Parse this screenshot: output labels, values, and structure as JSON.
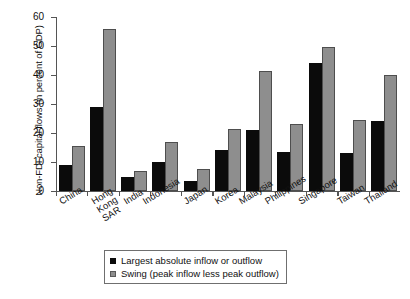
{
  "chart_data": {
    "type": "bar",
    "title": "",
    "xlabel": "",
    "ylabel": "Non-FDI capital flows (in percent of GDP)",
    "ylim": [
      0,
      60
    ],
    "yticks": [
      0,
      10,
      20,
      30,
      40,
      50,
      60
    ],
    "grid": false,
    "legend_position": "bottom-center",
    "categories": [
      "China",
      "Hong Kong\nSAR",
      "India",
      "Indonesia",
      "Japan",
      "Korea",
      "Malaysia",
      "Philippines",
      "Singapore",
      "Taiwan",
      "Thailand"
    ],
    "series": [
      {
        "name": "Largest absolute inflow or outflow",
        "color": "#0b0b0b",
        "values": [
          9,
          29,
          5,
          10,
          3.5,
          14,
          21,
          13.5,
          44,
          13,
          24
        ]
      },
      {
        "name": "Swing (peak inflow less peak outflow)",
        "color": "#8e8e8e",
        "values": [
          15.5,
          56,
          7,
          17,
          7.5,
          21.5,
          41.5,
          23,
          49.5,
          24.5,
          40
        ]
      }
    ]
  },
  "legend": {
    "items": [
      {
        "label": "Largest absolute inflow or outflow",
        "swatch": "black"
      },
      {
        "label": "Swing (peak inflow less peak outflow)",
        "swatch": "gray"
      }
    ]
  }
}
